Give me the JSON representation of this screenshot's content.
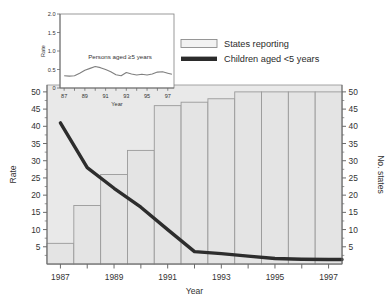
{
  "chart_data": {
    "type": "bar",
    "title": "",
    "xlabel": "Year",
    "ylabel": "Rate",
    "y2label": "No. states",
    "xlim": [
      1986.5,
      1997.5
    ],
    "ylim": [
      0,
      52
    ],
    "y2lim": [
      0,
      52
    ],
    "grid": false,
    "legend_position": "top-right",
    "categories": [
      1987,
      1988,
      1989,
      1990,
      1991,
      1992,
      1993,
      1994,
      1995,
      1996,
      1997
    ],
    "x_tick_labels": [
      "1987",
      "1989",
      "1991",
      "1993",
      "1995",
      "1997"
    ],
    "x_tick_values": [
      1987,
      1989,
      1991,
      1993,
      1995,
      1997
    ],
    "y_tick_labels": [
      "5",
      "10",
      "15",
      "20",
      "25",
      "30",
      "35",
      "40",
      "45",
      "50"
    ],
    "y_tick_values": [
      5,
      10,
      15,
      20,
      25,
      30,
      35,
      40,
      45,
      50
    ],
    "y2_tick_labels": [
      "5",
      "10",
      "15",
      "20",
      "25",
      "30",
      "35",
      "40",
      "45",
      "50"
    ],
    "y2_tick_values": [
      5,
      10,
      15,
      20,
      25,
      30,
      35,
      40,
      45,
      50
    ],
    "series": [
      {
        "name": "States reporting",
        "type": "bar",
        "axis": "right",
        "values": [
          6,
          17,
          26,
          33,
          46,
          47,
          48,
          50,
          50,
          50,
          50
        ]
      },
      {
        "name": "Children aged <5 years",
        "type": "line",
        "axis": "left",
        "values": [
          41,
          28,
          22,
          16.5,
          10,
          3.6,
          3.0,
          2.3,
          1.6,
          1.4,
          1.3
        ]
      }
    ]
  },
  "inset_chart": {
    "type": "line",
    "xlabel": "Year",
    "ylabel": "Rate",
    "annotation": "Persons aged ≥5 years",
    "ylim": [
      0,
      2.0
    ],
    "xlim": [
      1986.6,
      1997.6
    ],
    "y_tick_labels": [
      "0",
      "0.5",
      "1.0",
      "1.5",
      "2.0"
    ],
    "y_tick_values": [
      0,
      0.5,
      1.0,
      1.5,
      2.0
    ],
    "x_tick_labels": [
      "87",
      "89",
      "91",
      "93",
      "95",
      "97"
    ],
    "x_tick_values": [
      1987,
      1989,
      1991,
      1993,
      1995,
      1997
    ],
    "x": [
      1987,
      1987.5,
      1988,
      1988.5,
      1989,
      1989.5,
      1990,
      1990.5,
      1991,
      1991.5,
      1992,
      1992.5,
      1993,
      1993.5,
      1994,
      1994.5,
      1995,
      1995.5,
      1996,
      1996.5,
      1997,
      1997.4
    ],
    "values": [
      0.33,
      0.32,
      0.33,
      0.4,
      0.48,
      0.53,
      0.58,
      0.55,
      0.5,
      0.44,
      0.36,
      0.33,
      0.42,
      0.38,
      0.35,
      0.37,
      0.35,
      0.38,
      0.43,
      0.44,
      0.4,
      0.37
    ]
  },
  "legend": {
    "items": [
      {
        "label": "States reporting",
        "marker": "bar-swatch",
        "color": "#f2f2f2",
        "border": "#8c8c8c"
      },
      {
        "label": "Children aged <5 years",
        "marker": "line-swatch",
        "color": "#2b2b2b"
      }
    ]
  },
  "colors": {
    "plot_background": "#e9e9e9",
    "bar_fill": "#e4e4e4",
    "bar_border": "#9a9a9a",
    "line": "#2d2d2d",
    "axis": "#6b6b6b",
    "text": "#333333",
    "inset_background": "#ffffff",
    "inset_line": "#7f7f7f"
  }
}
